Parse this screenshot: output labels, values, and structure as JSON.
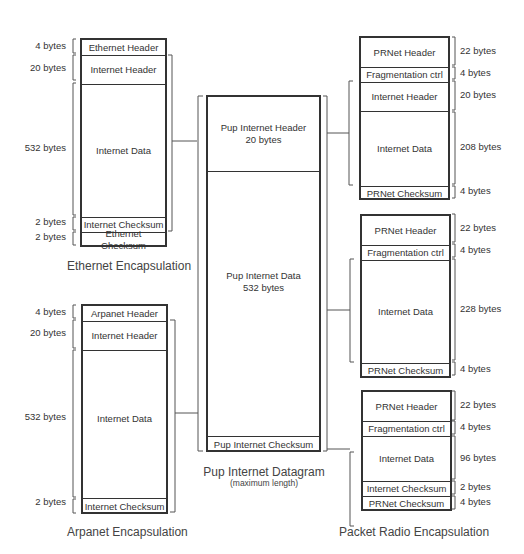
{
  "ethernet": {
    "caption": "Ethernet Encapsulation",
    "fields": [
      {
        "label": "Ethernet Header",
        "size": "4 bytes"
      },
      {
        "label": "Internet Header",
        "size": "20 bytes"
      },
      {
        "label": "Internet Data",
        "size": "532 bytes"
      },
      {
        "label": "Internet Checksum",
        "size": "2 bytes"
      },
      {
        "label": "Ethernet Checksum",
        "size": "2 bytes"
      }
    ]
  },
  "arpanet": {
    "caption": "Arpanet Encapsulation",
    "fields": [
      {
        "label": "Arpanet Header",
        "size": "4 bytes"
      },
      {
        "label": "Internet Header",
        "size": "20 bytes"
      },
      {
        "label": "Internet Data",
        "size": "532 bytes"
      },
      {
        "label": "Internet Checksum",
        "size": "2 bytes"
      }
    ]
  },
  "pup": {
    "caption": "Pup Internet Datagram",
    "subcaption": "(maximum length)",
    "header": {
      "label": "Pup Internet Header",
      "size": "20 bytes"
    },
    "data": {
      "label": "Pup Internet Data",
      "size": "532 bytes"
    },
    "checksum": {
      "label": "Pup Internet Checksum"
    }
  },
  "packet_radio": {
    "caption": "Packet Radio Encapsulation",
    "packets": [
      {
        "fields": [
          {
            "label": "PRNet Header",
            "size": "22 bytes"
          },
          {
            "label": "Fragmentation ctrl",
            "size": "4 bytes"
          },
          {
            "label": "Internet Header",
            "size": "20 bytes"
          },
          {
            "label": "Internet Data",
            "size": "208 bytes"
          },
          {
            "label": "PRNet Checksum",
            "size": "4 bytes"
          }
        ]
      },
      {
        "fields": [
          {
            "label": "PRNet Header",
            "size": "22 bytes"
          },
          {
            "label": "Fragmentation ctrl",
            "size": "4 bytes"
          },
          {
            "label": "Internet Data",
            "size": "228 bytes"
          },
          {
            "label": "PRNet Checksum",
            "size": "4 bytes"
          }
        ]
      },
      {
        "fields": [
          {
            "label": "PRNet Header",
            "size": "22 bytes"
          },
          {
            "label": "Fragmentation ctrl",
            "size": "4 bytes"
          },
          {
            "label": "Internet Data",
            "size": "96 bytes"
          },
          {
            "label": "Internet Checksum",
            "size": "2 bytes"
          },
          {
            "label": "PRNet Checksum",
            "size": "4 bytes"
          }
        ]
      }
    ]
  }
}
